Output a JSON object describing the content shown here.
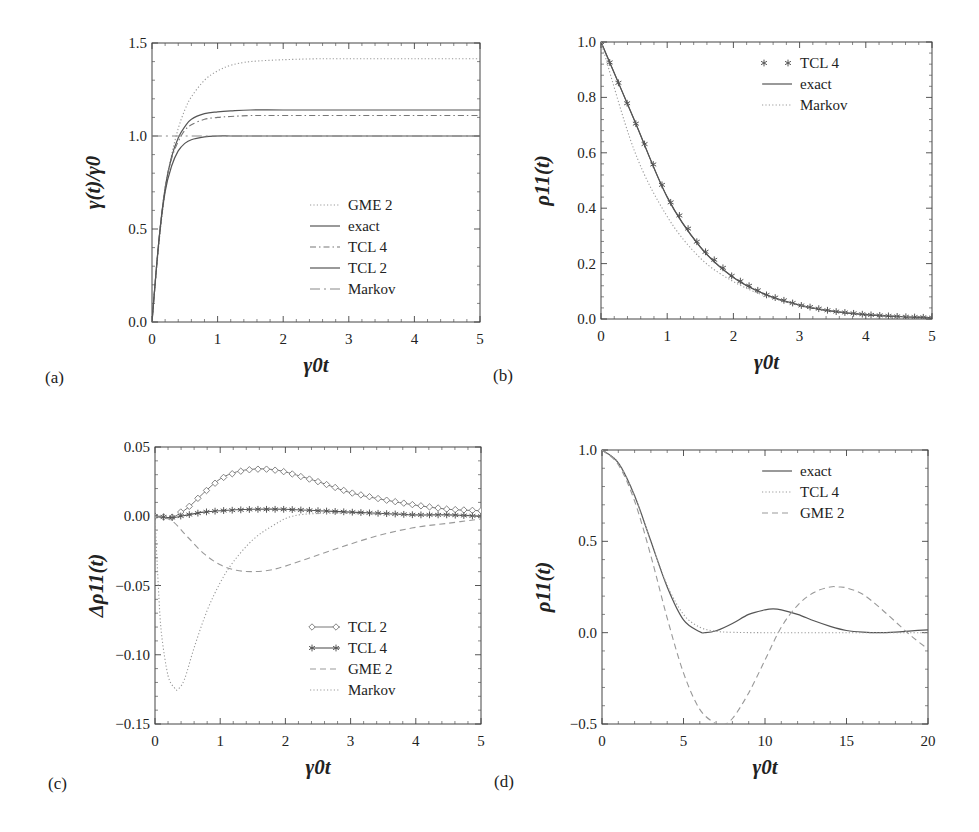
{
  "figure": {
    "panels": [
      "a",
      "b",
      "c",
      "d"
    ]
  },
  "chart_data": [
    {
      "panel_label": "(a)",
      "type": "line",
      "title": "",
      "xlabel": "γ0t",
      "ylabel": "γ(t)/γ0",
      "xlim": [
        0,
        5
      ],
      "ylim": [
        0,
        1.5
      ],
      "xticks": [
        "0",
        "1",
        "2",
        "3",
        "4",
        "5"
      ],
      "yticks": [
        "0.0",
        "0.5",
        "1.0",
        "1.5"
      ],
      "grid": false,
      "legend_position": "center-right",
      "series": [
        {
          "name": "GME 2",
          "style": "dotted",
          "x": [
            0,
            0.1,
            0.2,
            0.3,
            0.4,
            0.5,
            0.6,
            0.8,
            1.0,
            1.2,
            1.5,
            2.0,
            2.5,
            3,
            4,
            5
          ],
          "values": [
            0,
            0.4,
            0.7,
            0.9,
            1.04,
            1.14,
            1.21,
            1.3,
            1.35,
            1.38,
            1.4,
            1.41,
            1.415,
            1.415,
            1.415,
            1.415
          ]
        },
        {
          "name": "exact",
          "style": "solid",
          "x": [
            0,
            0.1,
            0.2,
            0.3,
            0.4,
            0.5,
            0.6,
            0.8,
            1.0,
            1.2,
            1.5,
            2.0,
            3,
            4,
            5
          ],
          "values": [
            0,
            0.42,
            0.72,
            0.89,
            0.99,
            1.05,
            1.09,
            1.12,
            1.13,
            1.135,
            1.14,
            1.14,
            1.14,
            1.14,
            1.14
          ]
        },
        {
          "name": "TCL 4",
          "style": "dash-dot",
          "x": [
            0,
            0.1,
            0.2,
            0.3,
            0.4,
            0.5,
            0.6,
            0.8,
            1.0,
            1.2,
            1.5,
            2.0,
            3,
            4,
            5
          ],
          "values": [
            0,
            0.42,
            0.72,
            0.88,
            0.97,
            1.03,
            1.06,
            1.09,
            1.1,
            1.105,
            1.11,
            1.11,
            1.11,
            1.11,
            1.11
          ]
        },
        {
          "name": "TCL 2",
          "style": "solid",
          "x": [
            0,
            0.1,
            0.2,
            0.3,
            0.4,
            0.5,
            0.6,
            0.8,
            1.0,
            1.2,
            1.5,
            2.0,
            3,
            4,
            5
          ],
          "values": [
            0,
            0.42,
            0.7,
            0.84,
            0.92,
            0.96,
            0.98,
            0.995,
            1.0,
            1.0,
            1.0,
            1.0,
            1.0,
            1.0,
            1.0
          ]
        },
        {
          "name": "Markov",
          "style": "long-dash-dot",
          "x": [
            0,
            5
          ],
          "values": [
            1.0,
            1.0
          ]
        }
      ]
    },
    {
      "panel_label": "(b)",
      "type": "line",
      "title": "",
      "xlabel": "γ0t",
      "ylabel": "ρ11(t)",
      "xlim": [
        0,
        5
      ],
      "ylim": [
        0,
        1.0
      ],
      "xticks": [
        "0",
        "1",
        "2",
        "3",
        "4",
        "5"
      ],
      "yticks": [
        "0.0",
        "0.2",
        "0.4",
        "0.6",
        "0.8",
        "1.0"
      ],
      "grid": false,
      "legend_position": "upper-right",
      "series": [
        {
          "name": "TCL 4",
          "style": "star-markers",
          "x": [
            0,
            0.5,
            1.0,
            1.5,
            2.0,
            2.5,
            3.0,
            3.5,
            4.0,
            4.5,
            5.0
          ],
          "values": [
            1.0,
            0.72,
            0.44,
            0.26,
            0.15,
            0.087,
            0.05,
            0.028,
            0.016,
            0.009,
            0.005
          ]
        },
        {
          "name": "exact",
          "style": "solid",
          "x": [
            0,
            0.5,
            1.0,
            1.5,
            2.0,
            2.5,
            3.0,
            3.5,
            4.0,
            4.5,
            5.0
          ],
          "values": [
            1.0,
            0.72,
            0.44,
            0.26,
            0.15,
            0.087,
            0.05,
            0.028,
            0.016,
            0.009,
            0.005
          ]
        },
        {
          "name": "Markov",
          "style": "dotted",
          "x": [
            0,
            0.5,
            1.0,
            1.5,
            2.0,
            2.5,
            3.0,
            3.5,
            4.0,
            4.5,
            5.0
          ],
          "values": [
            1.0,
            0.61,
            0.37,
            0.22,
            0.135,
            0.082,
            0.05,
            0.03,
            0.018,
            0.011,
            0.007
          ]
        }
      ]
    },
    {
      "panel_label": "(c)",
      "type": "line",
      "title": "",
      "xlabel": "γ0t",
      "ylabel": "Δρ11(t)",
      "xlim": [
        0,
        5
      ],
      "ylim": [
        -0.15,
        0.05
      ],
      "xticks": [
        "0",
        "1",
        "2",
        "3",
        "4",
        "5"
      ],
      "yticks": [
        "0.05",
        "0.00",
        "-0.05",
        "-0.10",
        "-0.15"
      ],
      "grid": false,
      "legend_position": "lower-right",
      "series": [
        {
          "name": "TCL 2",
          "style": "diamond-markers",
          "x": [
            0,
            0.25,
            0.5,
            0.75,
            1.0,
            1.25,
            1.5,
            1.75,
            2.0,
            2.5,
            3.0,
            3.5,
            4.0,
            4.5,
            5.0
          ],
          "values": [
            0,
            -0.001,
            0.006,
            0.017,
            0.027,
            0.032,
            0.034,
            0.034,
            0.032,
            0.025,
            0.017,
            0.012,
            0.008,
            0.005,
            0.004
          ]
        },
        {
          "name": "TCL 4",
          "style": "star-markers",
          "x": [
            0,
            0.25,
            0.5,
            0.75,
            1.0,
            1.5,
            2.0,
            2.5,
            3.0,
            3.5,
            4.0,
            4.5,
            5.0
          ],
          "values": [
            0,
            -0.001,
            0.001,
            0.003,
            0.004,
            0.005,
            0.005,
            0.004,
            0.003,
            0.002,
            0.001,
            0.001,
            0.0
          ]
        },
        {
          "name": "GME 2",
          "style": "dashed",
          "x": [
            0,
            0.25,
            0.5,
            0.75,
            1.0,
            1.25,
            1.5,
            1.75,
            2.0,
            2.5,
            3.0,
            3.5,
            4.0,
            4.5,
            5.0
          ],
          "values": [
            0,
            -0.003,
            -0.015,
            -0.027,
            -0.035,
            -0.039,
            -0.04,
            -0.039,
            -0.036,
            -0.028,
            -0.02,
            -0.013,
            -0.008,
            -0.005,
            -0.002
          ]
        },
        {
          "name": "Markov",
          "style": "dotted",
          "x": [
            0,
            0.05,
            0.1,
            0.2,
            0.3,
            0.35,
            0.45,
            0.6,
            0.8,
            1.0,
            1.2,
            1.5,
            1.8,
            2.1,
            2.5,
            3.0,
            4.0,
            5.0
          ],
          "values": [
            0,
            -0.05,
            -0.085,
            -0.115,
            -0.124,
            -0.125,
            -0.118,
            -0.095,
            -0.068,
            -0.048,
            -0.033,
            -0.017,
            -0.007,
            0.0,
            0.002,
            0.002,
            0.001,
            0.0
          ]
        }
      ]
    },
    {
      "panel_label": "(d)",
      "type": "line",
      "title": "",
      "xlabel": "γ0t",
      "ylabel": "ρ11(t)",
      "xlim": [
        0,
        20
      ],
      "ylim": [
        -0.5,
        1.0
      ],
      "xticks": [
        "0",
        "5",
        "10",
        "15",
        "20"
      ],
      "yticks": [
        "1.0",
        "0.5",
        "0.0",
        "-0.5"
      ],
      "grid": false,
      "legend_position": "upper-right",
      "series": [
        {
          "name": "exact",
          "style": "solid",
          "x": [
            0,
            1,
            2,
            3,
            4,
            5,
            6,
            6.3,
            7,
            8,
            9,
            10,
            10.5,
            11,
            12,
            13,
            14,
            15,
            16,
            17,
            18,
            19,
            20
          ],
          "values": [
            1.0,
            0.93,
            0.75,
            0.5,
            0.25,
            0.07,
            0.005,
            0.0,
            0.01,
            0.05,
            0.1,
            0.125,
            0.13,
            0.125,
            0.1,
            0.065,
            0.035,
            0.012,
            0.003,
            0.0,
            0.003,
            0.01,
            0.015
          ]
        },
        {
          "name": "TCL 4",
          "style": "dotted",
          "x": [
            0,
            1,
            2,
            3,
            4,
            5,
            6,
            7,
            8,
            10,
            15,
            20
          ],
          "values": [
            1.0,
            0.93,
            0.75,
            0.5,
            0.26,
            0.1,
            0.03,
            0.008,
            0.002,
            0.0,
            0.0,
            0.0
          ]
        },
        {
          "name": "GME 2",
          "style": "dashed",
          "x": [
            0,
            1,
            2,
            3,
            4,
            5,
            6,
            7,
            7.3,
            8,
            9,
            10,
            11,
            12,
            13,
            14,
            14.5,
            15,
            16,
            17,
            18,
            19,
            20
          ],
          "values": [
            1.0,
            0.92,
            0.72,
            0.42,
            0.08,
            -0.22,
            -0.42,
            -0.5,
            -0.51,
            -0.47,
            -0.33,
            -0.15,
            0.03,
            0.15,
            0.22,
            0.25,
            0.25,
            0.245,
            0.21,
            0.14,
            0.06,
            -0.02,
            -0.09
          ]
        }
      ]
    }
  ],
  "labels": {
    "a": {
      "tag": "(a)",
      "legend": [
        "GME 2",
        "exact",
        "TCL 4",
        "TCL 2",
        "Markov"
      ]
    },
    "b": {
      "tag": "(b)",
      "legend": [
        "TCL 4",
        "exact",
        "Markov"
      ]
    },
    "c": {
      "tag": "(c)",
      "legend": [
        "TCL 2",
        "TCL 4",
        "GME 2",
        "Markov"
      ]
    },
    "d": {
      "tag": "(d)",
      "legend": [
        "exact",
        "TCL 4",
        "GME 2"
      ]
    }
  }
}
